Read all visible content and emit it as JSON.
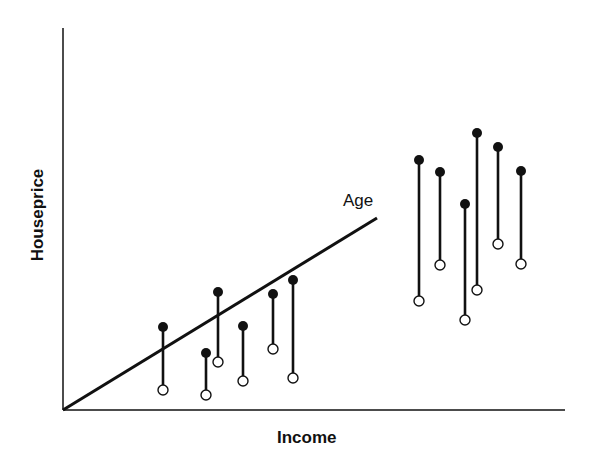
{
  "chart_data": {
    "type": "scatter",
    "title": "",
    "xlabel": "Income",
    "ylabel": "Houseprice",
    "grid": false,
    "legend": null,
    "annotations": [
      {
        "text": "Age",
        "kind": "trend-line label"
      }
    ],
    "trend_line": {
      "label": "Age",
      "from_px": [
        63,
        410
      ],
      "to_px": [
        377,
        218
      ]
    },
    "axes_px": {
      "origin": [
        63,
        410
      ],
      "y_top": 28,
      "x_right": 565
    },
    "pairs_px": [
      {
        "x": 163,
        "filled_y": 327,
        "open_y": 390
      },
      {
        "x": 206,
        "filled_y": 353,
        "open_y": 395
      },
      {
        "x": 218,
        "filled_y": 292,
        "open_y": 362
      },
      {
        "x": 243,
        "filled_y": 326,
        "open_y": 381
      },
      {
        "x": 273,
        "filled_y": 294,
        "open_y": 349
      },
      {
        "x": 293,
        "filled_y": 280,
        "open_y": 378
      },
      {
        "x": 419,
        "filled_y": 160,
        "open_y": 301
      },
      {
        "x": 440,
        "filled_y": 172,
        "open_y": 265
      },
      {
        "x": 465,
        "filled_y": 204,
        "open_y": 320
      },
      {
        "x": 477,
        "filled_y": 133,
        "open_y": 290
      },
      {
        "x": 498,
        "filled_y": 147,
        "open_y": 244
      },
      {
        "x": 521,
        "filled_y": 171,
        "open_y": 264
      }
    ],
    "series": [
      {
        "name": "filled markers (with age effect)",
        "marker": "filled circle"
      },
      {
        "name": "open markers (without age effect)",
        "marker": "open circle"
      }
    ]
  },
  "labels": {
    "x_axis": "Income",
    "y_axis": "Houseprice",
    "line": "Age"
  },
  "colors": {
    "ink": "#111111",
    "background": "#ffffff"
  }
}
